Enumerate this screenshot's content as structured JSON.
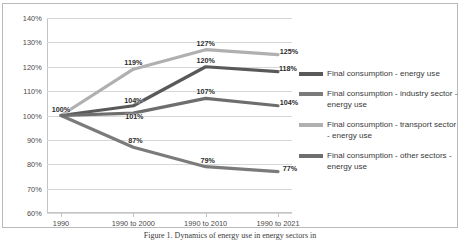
{
  "chart_data": {
    "type": "line",
    "title": "",
    "xlabel": "",
    "ylabel": "",
    "categories": [
      "1990",
      "1990 to 2000",
      "1990 to 2010",
      "1990 to 2021"
    ],
    "ylim": [
      60,
      140
    ],
    "ytick_labels": [
      "140%",
      "130%",
      "120%",
      "110%",
      "100%",
      "90%",
      "80%",
      "70%",
      "60%"
    ],
    "ytick_values": [
      140,
      130,
      120,
      110,
      100,
      90,
      80,
      70,
      60
    ],
    "grid": true,
    "legend_position": "right",
    "series": [
      {
        "name": "Final consumption - energy use",
        "color": "#595959",
        "values": [
          100,
          104,
          120,
          118
        ],
        "labels": [
          "100%",
          "104%",
          "120%",
          "118%"
        ]
      },
      {
        "name": "Final consumption - industry sector - energy use",
        "color": "#7b7b7b",
        "values": [
          100,
          87,
          79,
          77
        ],
        "labels": [
          "100%",
          "87%",
          "79%",
          "77%"
        ]
      },
      {
        "name": "Final consumption - transport sector - energy use",
        "color": "#b0b0b0",
        "values": [
          100,
          119,
          127,
          125
        ],
        "labels": [
          "100%",
          "119%",
          "127%",
          "125%"
        ]
      },
      {
        "name": "Final consumption - other sectors - energy use",
        "color": "#6e6e6e",
        "values": [
          100,
          101,
          107,
          104
        ],
        "labels": [
          "100%",
          "101%",
          "107%",
          "104%"
        ]
      }
    ]
  },
  "legend": {
    "items": [
      {
        "label": "Final consumption - energy use"
      },
      {
        "label": "Final consumption - industry sector - energy use"
      },
      {
        "label": "Final consumption - transport sector - energy use"
      },
      {
        "label": "Final consumption - other sectors - energy use"
      }
    ]
  },
  "caption": {
    "text": "Figure 1. Dynamics of energy use in energy sectors in"
  }
}
